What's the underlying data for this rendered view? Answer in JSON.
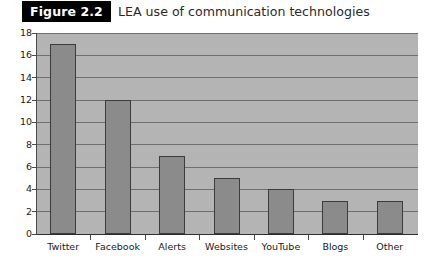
{
  "header": {
    "badge_label": "Figure 2.2",
    "title": "LEA use of communication technologies"
  },
  "colors": {
    "badge_background": "#000000",
    "badge_text": "#ffffff",
    "plot_background": "#b4b4b4",
    "bar_fill": "#8b8b8b",
    "bar_border": "#3c3c3c",
    "gridline": "#6f6f6f",
    "axis": "#2e2e2e"
  },
  "chart_data": {
    "type": "bar",
    "title": "LEA use of communication technologies",
    "xlabel": "",
    "ylabel": "",
    "categories": [
      "Twitter",
      "Facebook",
      "Alerts",
      "Websites",
      "YouTube",
      "Blogs",
      "Other"
    ],
    "values": [
      17,
      12,
      7,
      5,
      4,
      3,
      3
    ],
    "ylim": [
      0,
      18
    ],
    "ytick_step": 2,
    "yticks": [
      0,
      2,
      4,
      6,
      8,
      10,
      12,
      14,
      16,
      18
    ],
    "ytick_labels": [
      "0",
      "2",
      "4",
      "6",
      "8",
      "10",
      "12",
      "14",
      "16",
      "18"
    ],
    "grid": true,
    "grid_axis": "y",
    "legend": false,
    "legend_position": "none"
  }
}
